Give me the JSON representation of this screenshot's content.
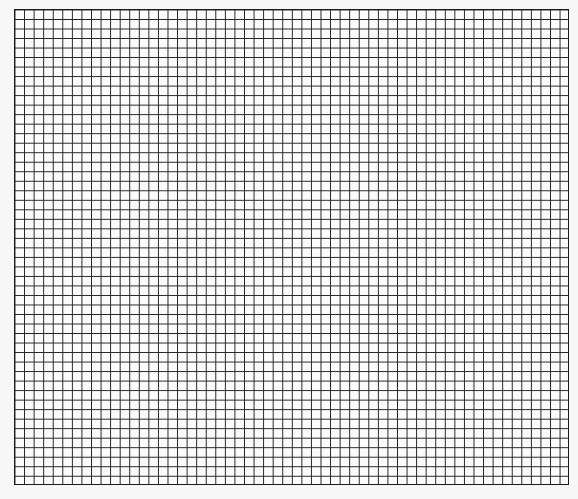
{
  "sheet": {
    "type": "graph-paper",
    "columns": 58,
    "rows": 50,
    "line_color": "#222222",
    "paper_color": "#fbfbfb",
    "background_color": "#f7f7f7"
  }
}
